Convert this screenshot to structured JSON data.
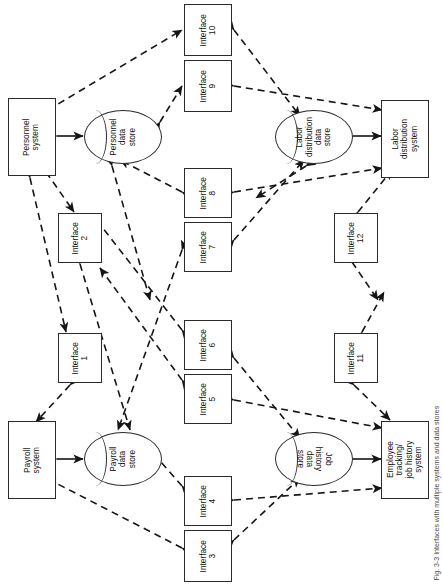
{
  "figure": {
    "caption": "Fig. 3-3   Interfaces with multiple systems and data stores",
    "orientation": "rotated-90-ccw",
    "line_style": "dashed",
    "stroke_color": "#1a1a1a",
    "background": "#ffffff"
  },
  "systems": [
    {
      "id": "personnel-system",
      "label": "Personnel\nsystem",
      "lines": [
        "Personnel",
        "system"
      ]
    },
    {
      "id": "labor-distribution-system",
      "label": "Labor\ndistribution\nsystem",
      "lines": [
        "Labor",
        "distribution",
        "system"
      ]
    },
    {
      "id": "payroll-system",
      "label": "Payroll\nsystem",
      "lines": [
        "Payroll",
        "system"
      ]
    },
    {
      "id": "employee-tracking-system",
      "label": "Employee\ntracking/\njob history\nsystem",
      "lines": [
        "Employee",
        "tracking/",
        "job history",
        "system"
      ]
    }
  ],
  "data_stores": [
    {
      "id": "personnel-data-store",
      "label": "Personnel\ndata\nstore",
      "lines": [
        "Personnel",
        "data",
        "store"
      ]
    },
    {
      "id": "labor-distribution-data-store",
      "label": "Labor\ndistribution\ndata\nstore",
      "lines": [
        "Labor",
        "distribution",
        "data",
        "store"
      ]
    },
    {
      "id": "payroll-data-store",
      "label": "Payroll\ndata\nstore",
      "lines": [
        "Payroll",
        "data",
        "store"
      ]
    },
    {
      "id": "job-history-data-store",
      "label": "Job\nhistory\ndata\nstore",
      "lines": [
        "Job",
        "history",
        "data",
        "store"
      ]
    }
  ],
  "interfaces": [
    {
      "id": "interface-1",
      "line1": "Interface",
      "line2": "1"
    },
    {
      "id": "interface-2",
      "line1": "Interface",
      "line2": "2"
    },
    {
      "id": "interface-3",
      "line1": "Interface",
      "line2": "3"
    },
    {
      "id": "interface-4",
      "line1": "Interface",
      "line2": "4"
    },
    {
      "id": "interface-5",
      "line1": "Interface",
      "line2": "5"
    },
    {
      "id": "interface-6",
      "line1": "Interface",
      "line2": "6"
    },
    {
      "id": "interface-7",
      "line1": "Interface",
      "line2": "7"
    },
    {
      "id": "interface-8",
      "line1": "Interface",
      "line2": "8"
    },
    {
      "id": "interface-9",
      "line1": "Interface",
      "line2": "9"
    },
    {
      "id": "interface-10",
      "line1": "Interface",
      "line2": "10"
    },
    {
      "id": "interface-11",
      "line1": "Interface",
      "line2": "11"
    },
    {
      "id": "interface-12",
      "line1": "Interface",
      "line2": "12"
    }
  ],
  "connections": [
    {
      "from": "personnel-system",
      "to": "personnel-data-store",
      "arrows": "both"
    },
    {
      "from": "labor-distribution-data-store",
      "to": "labor-distribution-system",
      "arrows": "both"
    },
    {
      "from": "payroll-system",
      "to": "payroll-data-store",
      "arrows": "both"
    },
    {
      "from": "job-history-data-store",
      "to": "employee-tracking-system",
      "arrows": "both"
    },
    {
      "from": "personnel-system",
      "to": "interface-10",
      "arrows": "both"
    },
    {
      "from": "interface-10",
      "to": "labor-distribution-data-store",
      "arrows": "both"
    },
    {
      "from": "personnel-data-store",
      "to": "interface-9",
      "arrows": "both"
    },
    {
      "from": "interface-9",
      "to": "labor-distribution-system",
      "arrows": "both"
    },
    {
      "from": "interface-8",
      "to": "labor-distribution-system",
      "arrows": "both"
    },
    {
      "from": "interface-8",
      "to": "personnel-data-store",
      "arrows": "both"
    },
    {
      "from": "interface-7",
      "to": "labor-distribution-data-store",
      "arrows": "both"
    },
    {
      "from": "interface-7",
      "to": "payroll-data-store",
      "arrows": "both"
    },
    {
      "from": "personnel-system",
      "to": "interface-2",
      "arrows": "both"
    },
    {
      "from": "interface-2",
      "to": "payroll-data-store",
      "arrows": "both"
    },
    {
      "from": "personnel-system",
      "to": "interface-1",
      "arrows": "both"
    },
    {
      "from": "interface-1",
      "to": "payroll-system",
      "arrows": "both"
    },
    {
      "from": "interface-6",
      "to": "payroll-data-store",
      "arrows": "both"
    },
    {
      "from": "interface-6",
      "to": "job-history-data-store",
      "arrows": "both"
    },
    {
      "from": "interface-5",
      "to": "payroll-data-store",
      "arrows": "both"
    },
    {
      "from": "interface-5",
      "to": "employee-tracking-system",
      "arrows": "both"
    },
    {
      "from": "interface-4",
      "to": "payroll-data-store",
      "arrows": "both"
    },
    {
      "from": "interface-4",
      "to": "employee-tracking-system",
      "arrows": "both"
    },
    {
      "from": "interface-3",
      "to": "payroll-system",
      "arrows": "both"
    },
    {
      "from": "interface-3",
      "to": "job-history-data-store",
      "arrows": "both"
    },
    {
      "from": "interface-12",
      "to": "labor-distribution-system",
      "arrows": "both"
    },
    {
      "from": "interface-12",
      "to": "job-history-data-store",
      "arrows": "both"
    },
    {
      "from": "interface-11",
      "to": "labor-distribution-data-store",
      "arrows": "both"
    },
    {
      "from": "interface-11",
      "to": "employee-tracking-system",
      "arrows": "both"
    }
  ]
}
